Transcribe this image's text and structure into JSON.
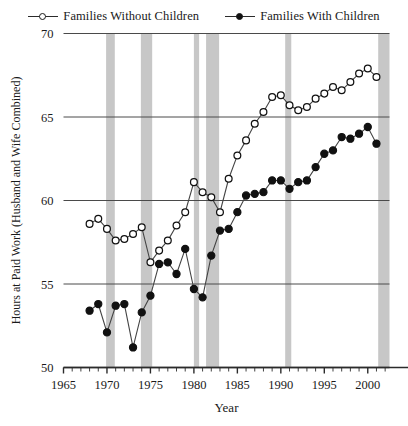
{
  "chart_data": {
    "type": "line",
    "title": "",
    "xlabel": "Year",
    "ylabel": "Hours at Paid Work (Husband and Wife Combined)",
    "xlim": [
      1965,
      2002.5
    ],
    "ylim": [
      50,
      70
    ],
    "xticks_major": [
      1965,
      1970,
      1975,
      1980,
      1985,
      1990,
      1995,
      2000
    ],
    "xtick_labels": [
      "1965",
      "1970",
      "1975",
      "1980",
      "1985",
      "1990",
      "1995",
      "2000"
    ],
    "xticks_minor_step": 1,
    "yticks": [
      50,
      55,
      60,
      65,
      70
    ],
    "ytick_labels": [
      "50",
      "55",
      "60",
      "65",
      "70"
    ],
    "grid": "horizontal",
    "legend_position": "top-center",
    "shaded_bands_label": "recession",
    "shaded_bands": [
      {
        "start": 1969.9,
        "end": 1970.9
      },
      {
        "start": 1973.9,
        "end": 1975.2
      },
      {
        "start": 1980.0,
        "end": 1980.6
      },
      {
        "start": 1981.4,
        "end": 1982.9
      },
      {
        "start": 1990.5,
        "end": 1991.2
      },
      {
        "start": 2001.2,
        "end": 2002.5
      }
    ],
    "series": [
      {
        "name": "Families Without Children",
        "marker": "open-circle",
        "color": "#111111",
        "x": [
          1968,
          1969,
          1970,
          1971,
          1972,
          1973,
          1974,
          1975,
          1976,
          1977,
          1978,
          1979,
          1980,
          1981,
          1982,
          1983,
          1984,
          1985,
          1986,
          1987,
          1988,
          1989,
          1990,
          1991,
          1992,
          1993,
          1994,
          1995,
          1996,
          1997,
          1998,
          1999,
          2000,
          2001
        ],
        "values": [
          58.6,
          58.9,
          58.3,
          57.6,
          57.7,
          58.0,
          58.4,
          56.3,
          57.0,
          57.6,
          58.5,
          59.3,
          61.1,
          60.5,
          60.2,
          59.3,
          61.3,
          62.7,
          63.6,
          64.6,
          65.3,
          66.2,
          66.3,
          65.7,
          65.4,
          65.6,
          66.1,
          66.4,
          66.8,
          66.6,
          67.1,
          67.6,
          67.9,
          67.4
        ]
      },
      {
        "name": "Families With Children",
        "marker": "filled-circle",
        "color": "#111111",
        "x": [
          1968,
          1969,
          1970,
          1971,
          1972,
          1973,
          1974,
          1975,
          1976,
          1977,
          1978,
          1979,
          1980,
          1981,
          1982,
          1983,
          1984,
          1985,
          1986,
          1987,
          1988,
          1989,
          1990,
          1991,
          1992,
          1993,
          1994,
          1995,
          1996,
          1997,
          1998,
          1999,
          2000,
          2001
        ],
        "values": [
          53.4,
          53.8,
          52.1,
          53.7,
          53.8,
          51.2,
          53.3,
          54.3,
          56.2,
          56.3,
          55.6,
          57.1,
          54.7,
          54.2,
          56.7,
          58.2,
          58.3,
          59.3,
          60.3,
          60.4,
          60.5,
          61.2,
          61.2,
          60.7,
          61.1,
          61.2,
          62.0,
          62.8,
          63.0,
          63.8,
          63.7,
          64.0,
          64.4,
          63.4
        ]
      }
    ]
  },
  "legend": {
    "items": [
      {
        "label": "Families Without Children",
        "marker": "open-circle"
      },
      {
        "label": "Families With Children",
        "marker": "filled-circle"
      }
    ]
  }
}
